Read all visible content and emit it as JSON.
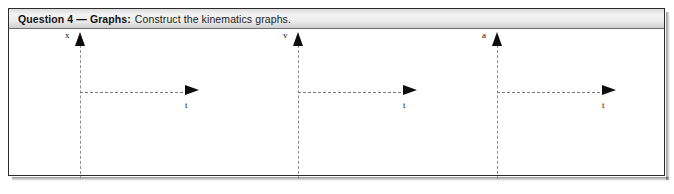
{
  "question": {
    "title": "Question 4 — Graphs:",
    "prompt": "Construct the kinematics graphs."
  },
  "graphs": [
    {
      "name": "position-time-graph",
      "y_label": "x",
      "x_label": "t",
      "y_axis_icon": "arrow-up-icon",
      "x_axis_icon": "arrow-right-icon"
    },
    {
      "name": "velocity-time-graph",
      "y_label": "v",
      "x_label": "t",
      "y_axis_icon": "arrow-up-icon",
      "x_axis_icon": "arrow-right-icon"
    },
    {
      "name": "acceleration-time-graph",
      "y_label": "a",
      "x_label": "t",
      "y_axis_icon": "arrow-up-icon",
      "x_axis_icon": "arrow-right-icon"
    }
  ],
  "colors": {
    "border": "#2b2b2b",
    "header_bg": "#ededed",
    "axis": "#8f8f8f",
    "arrow": "#0d0d0d",
    "text": "#111111"
  }
}
